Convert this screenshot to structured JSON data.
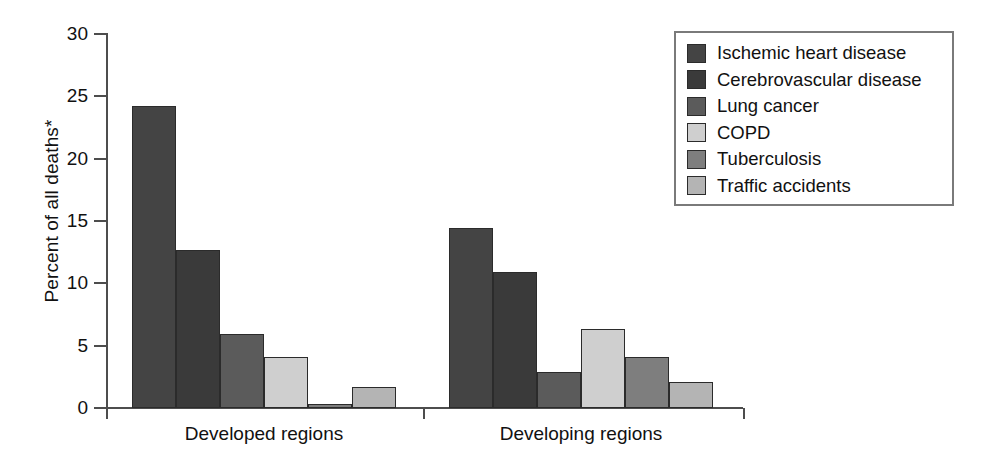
{
  "chart_data": {
    "type": "bar",
    "title": "",
    "xlabel": "",
    "ylabel": "Percent of all deaths*",
    "ylim": [
      0,
      30
    ],
    "yticks": [
      0,
      5,
      10,
      15,
      20,
      25,
      30
    ],
    "ytick_labels": [
      "0",
      "5",
      "10",
      "15",
      "20",
      "25",
      "30"
    ],
    "grid": false,
    "legend_position": "top-right",
    "categories": [
      "Developed regions",
      "Developing regions"
    ],
    "series": [
      {
        "name": "Ischemic heart disease",
        "color": "#444444",
        "values": [
          24.2,
          14.4
        ]
      },
      {
        "name": "Cerebrovascular disease",
        "color": "#3a3a3a",
        "values": [
          12.7,
          10.9
        ]
      },
      {
        "name": "Lung cancer",
        "color": "#5b5b5b",
        "values": [
          5.9,
          2.9
        ]
      },
      {
        "name": "COPD",
        "color": "#cfcfcf",
        "values": [
          4.1,
          6.3
        ]
      },
      {
        "name": "Tuberculosis",
        "color": "#7e7e7e",
        "values": [
          0.35,
          4.1
        ]
      },
      {
        "name": "Traffic accidents",
        "color": "#b4b4b4",
        "values": [
          1.7,
          2.1
        ]
      }
    ]
  },
  "legend": {
    "items": [
      {
        "label": "Ischemic heart disease"
      },
      {
        "label": "Cerebrovascular disease"
      },
      {
        "label": "Lung cancer"
      },
      {
        "label": "COPD"
      },
      {
        "label": "Tuberculosis"
      },
      {
        "label": "Traffic accidents"
      }
    ]
  }
}
